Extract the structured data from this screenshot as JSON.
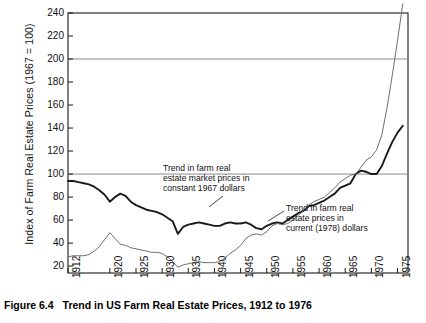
{
  "figure": {
    "caption_label": "Figure 6.4",
    "caption_title": "Trend in US Farm Real Estate Prices, 1912 to 1976"
  },
  "annotations": [
    {
      "name": "annotation-constant",
      "lines": [
        "Trend in farm real",
        "estate market prices in",
        "constant 1967 dollars"
      ]
    },
    {
      "name": "annotation-current",
      "lines": [
        "Trend in farm real",
        "estate prices in",
        "current (1978) dollars"
      ]
    }
  ],
  "colors": {
    "constant_line": "#1a1a1a",
    "current_line": "#6e6e6e",
    "axis": "#1a1a1a",
    "gridline": "#7d7d7d",
    "background": "#ffffff"
  },
  "chart_data": {
    "type": "line",
    "title": "Trend in US Farm Real Estate Prices, 1912 to 1976",
    "xlabel": "",
    "ylabel": "Index of Farm Real Estate Prices (1967 = 100)",
    "xlim": [
      1912,
      1977
    ],
    "ylim": [
      14,
      240
    ],
    "yticks": [
      20,
      40,
      60,
      80,
      100,
      120,
      140,
      160,
      180,
      200,
      220,
      240
    ],
    "xticks": [
      1912,
      1920,
      1925,
      1930,
      1935,
      1940,
      1945,
      1950,
      1955,
      1960,
      1965,
      1970,
      1975
    ],
    "gridlines": {
      "horizontal_at": [
        100,
        200
      ],
      "vertical": false
    },
    "legend": "none (in-plot annotations with leader lines)",
    "series": [
      {
        "name": "Trend in farm real estate market prices in constant 1967 dollars",
        "style": "thick-black",
        "x": [
          1912,
          1913,
          1914,
          1915,
          1916,
          1917,
          1918,
          1919,
          1920,
          1921,
          1922,
          1923,
          1924,
          1925,
          1926,
          1927,
          1928,
          1929,
          1930,
          1931,
          1932,
          1933,
          1934,
          1935,
          1936,
          1937,
          1938,
          1939,
          1940,
          1941,
          1942,
          1943,
          1944,
          1945,
          1946,
          1947,
          1948,
          1949,
          1950,
          1951,
          1952,
          1953,
          1954,
          1955,
          1956,
          1957,
          1958,
          1959,
          1960,
          1961,
          1962,
          1963,
          1964,
          1965,
          1966,
          1967,
          1968,
          1969,
          1970,
          1971,
          1972,
          1973,
          1974,
          1975,
          1976
        ],
        "values": [
          94,
          94,
          93,
          92,
          91,
          89,
          86,
          82,
          76,
          80,
          83,
          81,
          76,
          73,
          71,
          69,
          68,
          67,
          65,
          62,
          59,
          48,
          54,
          56,
          57,
          58,
          57,
          56,
          55,
          55,
          57,
          58,
          57,
          57,
          58,
          56,
          53,
          52,
          55,
          57,
          58,
          57,
          60,
          63,
          66,
          68,
          72,
          73,
          75,
          77,
          80,
          83,
          88,
          90,
          92,
          100,
          103,
          102,
          100,
          100,
          107,
          118,
          128,
          136,
          142
        ]
      },
      {
        "name": "Trend in farm real estate prices in current (1978) dollars",
        "style": "thin-gray",
        "x": [
          1912,
          1913,
          1914,
          1915,
          1916,
          1917,
          1918,
          1919,
          1920,
          1921,
          1922,
          1923,
          1924,
          1925,
          1926,
          1927,
          1928,
          1929,
          1930,
          1931,
          1932,
          1933,
          1934,
          1935,
          1936,
          1937,
          1938,
          1939,
          1940,
          1941,
          1942,
          1943,
          1944,
          1945,
          1946,
          1947,
          1948,
          1949,
          1950,
          1951,
          1952,
          1953,
          1954,
          1955,
          1956,
          1957,
          1958,
          1959,
          1960,
          1961,
          1962,
          1963,
          1964,
          1965,
          1966,
          1967,
          1968,
          1969,
          1970,
          1971,
          1972,
          1973,
          1974,
          1975,
          1976
        ],
        "values": [
          28,
          29,
          29,
          29,
          30,
          33,
          37,
          43,
          49,
          44,
          39,
          38,
          36,
          35,
          34,
          33,
          32,
          32,
          31,
          28,
          24,
          19,
          21,
          22,
          23,
          24,
          23,
          23,
          23,
          24,
          27,
          31,
          34,
          38,
          44,
          47,
          48,
          47,
          50,
          55,
          57,
          56,
          57,
          60,
          64,
          68,
          73,
          76,
          78,
          80,
          84,
          88,
          93,
          96,
          99,
          100,
          106,
          112,
          115,
          121,
          134,
          158,
          186,
          216,
          248
        ]
      }
    ]
  }
}
